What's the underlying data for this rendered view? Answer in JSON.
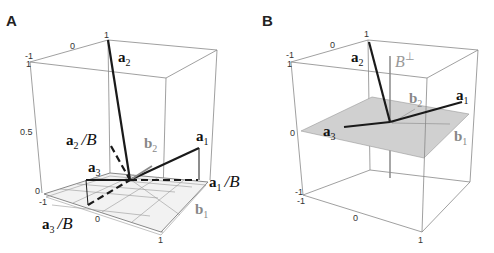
{
  "panels": [
    {
      "id": "A",
      "label": "A",
      "ticks": {
        "top_left_x": "-1",
        "top_mid_x": "0",
        "top_right_x": "1",
        "z_top": "1",
        "z_mid": "0.5",
        "z_bottom": "0",
        "bottom_left": "-1",
        "bottom_mid": "0",
        "bottom_right": "1"
      },
      "vectors": {
        "a1": {
          "base": "a",
          "sub": "1"
        },
        "a2": {
          "base": "a",
          "sub": "2"
        },
        "a3": {
          "base": "a",
          "sub": "3"
        },
        "b1": {
          "base": "b",
          "sub": "1"
        },
        "b2": {
          "base": "b",
          "sub": "2"
        }
      },
      "projections": {
        "a1_B": {
          "base": "a",
          "sub": "1",
          "slash": "/",
          "space": "B"
        },
        "a2_B": {
          "base": "a",
          "sub": "2",
          "slash": "/",
          "space": "B"
        },
        "a3_B": {
          "base": "a",
          "sub": "3",
          "slash": "/",
          "space": "B"
        }
      }
    },
    {
      "id": "B",
      "label": "B",
      "ticks": {
        "top_left_x": "-1",
        "top_mid_x": "0",
        "top_right_x": "1",
        "z_top": "1",
        "z_mid": "0",
        "z_bottom": "-1",
        "bottom_left": "-1",
        "bottom_mid": "0",
        "bottom_right": "1"
      },
      "vectors": {
        "a1": {
          "base": "a",
          "sub": "1"
        },
        "a2": {
          "base": "a",
          "sub": "2"
        },
        "a3": {
          "base": "a",
          "sub": "3"
        },
        "b1": {
          "base": "b",
          "sub": "1"
        },
        "b2": {
          "base": "b",
          "sub": "2"
        }
      },
      "orthogonal_complement": {
        "base": "B",
        "sup": "⊥"
      }
    }
  ],
  "colors": {
    "vector": "#1a1a1a",
    "basis": "#8a8a8a",
    "plane_fill": "#d0d0d0",
    "box": "#888888"
  }
}
